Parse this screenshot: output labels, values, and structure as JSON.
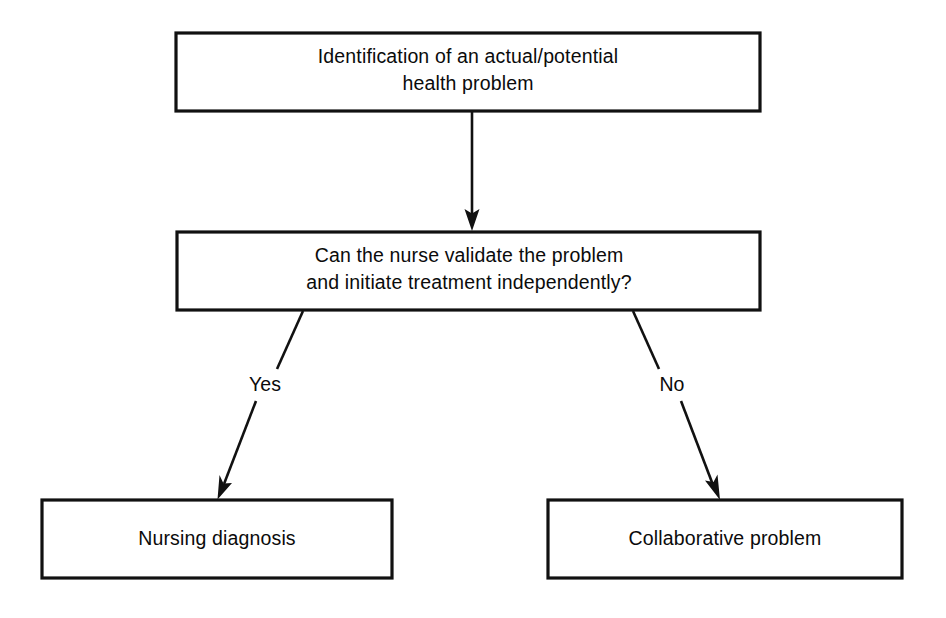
{
  "diagram": {
    "background_color": "#ffffff",
    "line_color": "#111111",
    "text_color": "#0b0b0b",
    "nodes": [
      {
        "id": "problem-identification",
        "shape": "rectangle",
        "lines": [
          "Identification of an actual/potential",
          "health problem"
        ],
        "x": 176,
        "y": 33,
        "width": 584,
        "height": 78
      },
      {
        "id": "nurse-validation-question",
        "shape": "rectangle",
        "lines": [
          "Can the nurse validate the problem",
          "and initiate treatment independently?"
        ],
        "x": 177,
        "y": 232,
        "width": 583,
        "height": 78
      },
      {
        "id": "nursing-diagnosis",
        "shape": "rectangle",
        "lines": [
          "Nursing diagnosis"
        ],
        "x": 42,
        "y": 500,
        "width": 350,
        "height": 78
      },
      {
        "id": "collaborative-problem",
        "shape": "rectangle",
        "lines": [
          "Collaborative problem"
        ],
        "x": 548,
        "y": 500,
        "width": 354,
        "height": 78
      }
    ],
    "connectors": [
      {
        "id": "identification-to-question",
        "from": "problem-identification",
        "to": "nurse-validation-question",
        "label": "",
        "x1": 472,
        "y1": 111,
        "x2": 472,
        "y2": 230,
        "arrow": "end"
      },
      {
        "id": "question-to-nursing-diagnosis",
        "from": "nurse-validation-question",
        "to": "nursing-diagnosis",
        "label": "Yes",
        "label_x": 265,
        "label_y": 385,
        "x1": 303,
        "y1": 311,
        "x2": 218,
        "y2": 497,
        "arrow": "end"
      },
      {
        "id": "question-to-collaborative-problem",
        "from": "nurse-validation-question",
        "to": "collaborative-problem",
        "label": "No",
        "label_x": 672,
        "label_y": 385,
        "x1": 633,
        "y1": 311,
        "x2": 719,
        "y2": 498,
        "arrow": "end"
      }
    ]
  }
}
